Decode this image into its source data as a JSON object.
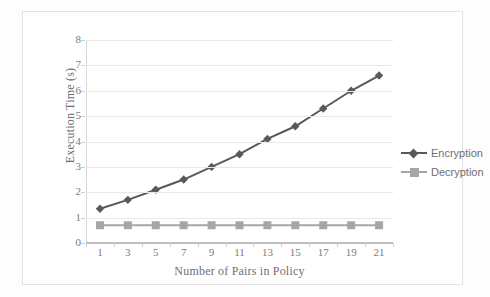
{
  "chart_data": {
    "type": "line",
    "title": "",
    "xlabel": "Number of Pairs in Policy",
    "ylabel": "Execution Time (s)",
    "categories": [
      "1",
      "3",
      "5",
      "7",
      "9",
      "11",
      "13",
      "15",
      "17",
      "19",
      "21"
    ],
    "x": [
      1,
      3,
      5,
      7,
      9,
      11,
      13,
      15,
      17,
      19,
      21
    ],
    "ylim": [
      0,
      8
    ],
    "yticks": [
      0,
      1,
      2,
      3,
      4,
      5,
      6,
      7,
      8
    ],
    "grid": true,
    "legend_position": "right",
    "series": [
      {
        "name": "Encryption",
        "marker": "diamond",
        "color": "#595959",
        "values": [
          1.35,
          1.7,
          2.1,
          2.5,
          3.0,
          3.5,
          4.1,
          4.6,
          5.3,
          6.0,
          6.6
        ]
      },
      {
        "name": "Decryption",
        "marker": "square",
        "color": "#a6a6a6",
        "values": [
          0.7,
          0.7,
          0.7,
          0.7,
          0.7,
          0.7,
          0.7,
          0.7,
          0.7,
          0.7,
          0.7
        ]
      }
    ]
  },
  "axes": {
    "y_title": "Execution Time (s)",
    "x_title": "Number of Pairs in Policy",
    "y_tick_labels": [
      "8",
      "7",
      "6",
      "5",
      "4",
      "3",
      "2",
      "1",
      "0"
    ],
    "x_tick_labels": [
      "1",
      "3",
      "5",
      "7",
      "9",
      "11",
      "13",
      "15",
      "17",
      "19",
      "21"
    ]
  },
  "legend": {
    "items": [
      {
        "label": "Encryption",
        "color": "#595959",
        "marker": "diamond-marker"
      },
      {
        "label": "Decryption",
        "color": "#a6a6a6",
        "marker": "square-marker"
      }
    ]
  },
  "colors": {
    "encryption": "#595959",
    "decryption": "#a6a6a6",
    "gridline": "#e8e8e8",
    "axis_text": "#7b7b7b",
    "frame": "#e3e3e3"
  }
}
